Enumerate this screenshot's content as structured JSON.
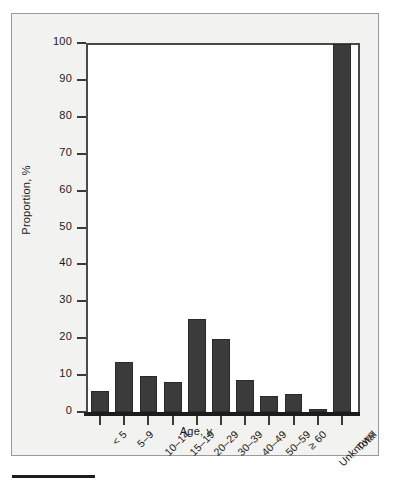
{
  "chart_data": {
    "type": "bar",
    "title": "",
    "xlabel": "Age, y",
    "ylabel": "Proportion, %",
    "categories": [
      "< 5",
      "5–9",
      "10–14",
      "15–19",
      "20–29",
      "30–39",
      "40–49",
      "50–59",
      "≥ 60",
      "Unknown",
      "Total"
    ],
    "values": [
      5.6,
      13.5,
      9.7,
      8.2,
      25.2,
      19.8,
      8.7,
      4.3,
      4.8,
      0.8,
      99.7
    ],
    "ylim": [
      0,
      100
    ],
    "yticks": [
      0,
      10,
      20,
      30,
      40,
      50,
      60,
      70,
      80,
      90,
      100
    ],
    "ytick_labels": [
      "0",
      "10",
      "20",
      "30",
      "40",
      "50",
      "60",
      "70",
      "80",
      "90",
      "100"
    ],
    "grid": false,
    "legend": null,
    "bar_color": "#3b3b3b",
    "plot_background": "#ffffff",
    "figure_background": "#f2f2f1",
    "axis_color": "#1c1c1c"
  }
}
